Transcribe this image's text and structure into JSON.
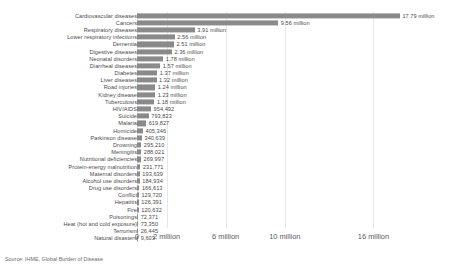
{
  "source_note": "Source: IHME, Global Burden of Disease",
  "axis": {
    "ticks": [
      {
        "label": "0",
        "value": 0
      },
      {
        "label": "2 million",
        "value": 2000000
      },
      {
        "label": "6 million",
        "value": 6000000
      },
      {
        "label": "10 million",
        "value": 10000000
      },
      {
        "label": "16 million",
        "value": 16000000
      }
    ]
  },
  "chart_data": {
    "type": "bar",
    "orientation": "horizontal",
    "title": "",
    "subtitle": "",
    "xlabel": "",
    "ylabel": "",
    "xlim": [
      0,
      18000000
    ],
    "grid": true,
    "legend": "none",
    "bar_color": "#8a8a8a",
    "source": "IHME, Global Burden of Disease",
    "axis_tick_labels": [
      "0",
      "2 million",
      "6 million",
      "10 million",
      "16 million"
    ],
    "axis_tick_values": [
      0,
      2000000,
      6000000,
      10000000,
      16000000
    ],
    "categories": [
      "Cardiovascular diseases",
      "Cancers",
      "Respiratory diseases",
      "Lower respiratory infections",
      "Dementia",
      "Digestive diseases",
      "Neonatal disorders",
      "Diarrheal diseases",
      "Diabetes",
      "Liver diseases",
      "Road injuries",
      "Kidney disease",
      "Tuberculosis",
      "HIV/AIDS",
      "Suicide",
      "Malaria",
      "Homicide",
      "Parkinson disease",
      "Drowning",
      "Meningitis",
      "Nutritional deficiencies",
      "Protein-energy malnutrition",
      "Maternal disorders",
      "Alcohol use disorders",
      "Drug use disorders",
      "Conflict",
      "Hepatitis",
      "Fire",
      "Poisonings",
      "Heat (hot and cold exposure)",
      "Terrorism",
      "Natural disasters"
    ],
    "values": [
      17790000,
      9560000,
      3910000,
      2560000,
      2510000,
      2360000,
      1780000,
      1570000,
      1370000,
      1320000,
      1240000,
      1230000,
      1180000,
      954492,
      793823,
      619827,
      405346,
      340639,
      295210,
      288021,
      269997,
      231771,
      193639,
      184934,
      166613,
      129720,
      126391,
      120632,
      72371,
      73350,
      26445,
      9603
    ],
    "value_labels": [
      "17.79 million",
      "9.56 million",
      "3.91 million",
      "2.56 million",
      "2.51 million",
      "2.36 million",
      "1.78 million",
      "1.57 million",
      "1.37 million",
      "1.32 million",
      "1.24 million",
      "1.23 million",
      "1.18 million",
      "954,492",
      "793,823",
      "619,827",
      "405,346",
      "340,639",
      "295,210",
      "288,021",
      "269,997",
      "231,771",
      "193,639",
      "184,934",
      "166,613",
      "129,720",
      "126,391",
      "120,632",
      "72,371",
      "73,350",
      "26,445",
      "9,603"
    ]
  }
}
